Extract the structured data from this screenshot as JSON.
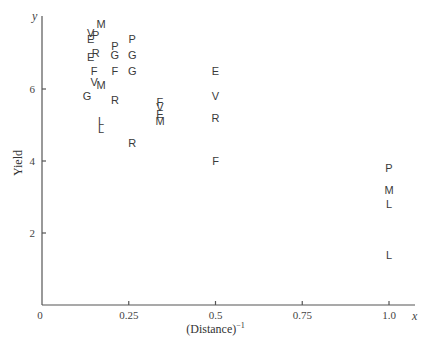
{
  "chart_data": {
    "type": "scatter",
    "title": "",
    "xlabel": "(Distance)",
    "xlabel_superscript": "−1",
    "ylabel": "Yield",
    "x_axis_var": "x",
    "y_axis_var": "y",
    "xlim": [
      0,
      1.1
    ],
    "ylim": [
      0,
      8
    ],
    "grid": false,
    "legend": "none",
    "x_ticks": [
      {
        "value": 0,
        "label": "0"
      },
      {
        "value": 0.25,
        "label": "0.25"
      },
      {
        "value": 0.5,
        "label": "0.5"
      },
      {
        "value": 0.75,
        "label": "0.75"
      },
      {
        "value": 1.0,
        "label": "1.0"
      }
    ],
    "y_ticks": [
      {
        "value": 2,
        "label": "2"
      },
      {
        "value": 4,
        "label": "4"
      },
      {
        "value": 6,
        "label": "6"
      }
    ],
    "marker": "letter",
    "points": [
      {
        "label": "M",
        "x": 0.17,
        "y": 7.8
      },
      {
        "label": "V",
        "x": 0.14,
        "y": 7.55
      },
      {
        "label": "P",
        "x": 0.155,
        "y": 7.5
      },
      {
        "label": "E",
        "x": 0.14,
        "y": 7.4
      },
      {
        "label": "P",
        "x": 0.26,
        "y": 7.4
      },
      {
        "label": "P",
        "x": 0.21,
        "y": 7.2
      },
      {
        "label": "E",
        "x": 0.14,
        "y": 6.9
      },
      {
        "label": "R",
        "x": 0.155,
        "y": 7.0
      },
      {
        "label": "G",
        "x": 0.21,
        "y": 6.95
      },
      {
        "label": "G",
        "x": 0.26,
        "y": 6.95
      },
      {
        "label": "F",
        "x": 0.15,
        "y": 6.5
      },
      {
        "label": "F",
        "x": 0.21,
        "y": 6.5
      },
      {
        "label": "G",
        "x": 0.26,
        "y": 6.5
      },
      {
        "label": "V",
        "x": 0.15,
        "y": 6.2
      },
      {
        "label": "M",
        "x": 0.17,
        "y": 6.1
      },
      {
        "label": "G",
        "x": 0.13,
        "y": 5.8
      },
      {
        "label": "R",
        "x": 0.21,
        "y": 5.7
      },
      {
        "label": "F",
        "x": 0.34,
        "y": 5.65
      },
      {
        "label": "V",
        "x": 0.34,
        "y": 5.5
      },
      {
        "label": "E",
        "x": 0.34,
        "y": 5.3
      },
      {
        "label": "M",
        "x": 0.34,
        "y": 5.1
      },
      {
        "label": "L",
        "x": 0.17,
        "y": 5.1
      },
      {
        "label": "L",
        "x": 0.17,
        "y": 4.9
      },
      {
        "label": "R",
        "x": 0.26,
        "y": 4.5
      },
      {
        "label": "E",
        "x": 0.5,
        "y": 6.5
      },
      {
        "label": "V",
        "x": 0.5,
        "y": 5.8
      },
      {
        "label": "R",
        "x": 0.5,
        "y": 5.2
      },
      {
        "label": "F",
        "x": 0.5,
        "y": 4.0
      },
      {
        "label": "P",
        "x": 1.0,
        "y": 3.8
      },
      {
        "label": "M",
        "x": 1.0,
        "y": 3.2
      },
      {
        "label": "L",
        "x": 1.0,
        "y": 2.8
      },
      {
        "label": "L",
        "x": 1.0,
        "y": 1.4
      }
    ]
  },
  "layout": {
    "origin_px": [
      42,
      305
    ],
    "x_px_per_unit": 347,
    "y_px_per_unit": 36,
    "x_axis_end_px": 415,
    "y_axis_top_px": 16
  }
}
